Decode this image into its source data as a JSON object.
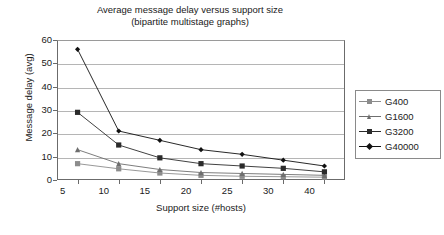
{
  "chart_data": {
    "type": "line",
    "title_line1": "Average message delay versus support size",
    "title_line2": "(bipartite multistage graphs)",
    "xlabel": "Support size (#hosts)",
    "ylabel": "Message delay (avg)",
    "categories": [
      "5",
      "10",
      "15",
      "20",
      "25",
      "30",
      "40"
    ],
    "x": [
      5,
      10,
      15,
      20,
      25,
      30,
      40
    ],
    "ylim": [
      0,
      60
    ],
    "yticks": [
      0,
      10,
      20,
      30,
      40,
      50,
      60
    ],
    "grid": true,
    "legend_position": "right",
    "series": [
      {
        "name": "G400",
        "color": "#8c8c8c",
        "marker": "square",
        "values": [
          7,
          4.8,
          3,
          2,
          1.6,
          1.4,
          1.2
        ]
      },
      {
        "name": "G1600",
        "color": "#6e6e6e",
        "marker": "triangle",
        "values": [
          13,
          7,
          4.5,
          3.2,
          2.8,
          2.4,
          2
        ]
      },
      {
        "name": "G3200",
        "color": "#2b2b2b",
        "marker": "square",
        "values": [
          29,
          15,
          9.5,
          7,
          6,
          5,
          3.5
        ]
      },
      {
        "name": "G40000",
        "color": "#111111",
        "marker": "diamond",
        "values": [
          56,
          21,
          17,
          13,
          11,
          8.5,
          6
        ]
      }
    ]
  },
  "legend": {
    "items": [
      {
        "label": "G400"
      },
      {
        "label": "G1600"
      },
      {
        "label": "G3200"
      },
      {
        "label": "G40000"
      }
    ]
  }
}
